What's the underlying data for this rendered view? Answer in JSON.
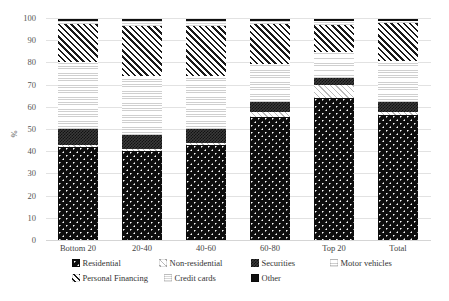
{
  "chart_data": {
    "type": "bar",
    "stacked": true,
    "stack_mode": "percent",
    "title": "",
    "xlabel": "",
    "ylabel": "%",
    "ylim": [
      0,
      100
    ],
    "yticks": [
      0,
      10,
      20,
      30,
      40,
      50,
      60,
      70,
      80,
      90,
      100
    ],
    "grid": true,
    "legend_position": "bottom",
    "categories": [
      "Bottom 20",
      "20-40",
      "40-60",
      "60-80",
      "Top 20",
      "Total"
    ],
    "series": [
      {
        "name": "Residential",
        "values": [
          42.0,
          40.3,
          43.0,
          55.5,
          64.0,
          56.5
        ],
        "pattern": "dotted-dark",
        "color": "#0d0d0d"
      },
      {
        "name": "Non-residential",
        "values": [
          1.0,
          0.7,
          1.0,
          2.5,
          6.0,
          1.5
        ],
        "pattern": "light-diagonal",
        "color": "#f3f3f3"
      },
      {
        "name": "Securities",
        "values": [
          7.0,
          6.2,
          6.0,
          4.5,
          3.2,
          4.5
        ],
        "pattern": "checker-dark",
        "color": "#3a3a3a"
      },
      {
        "name": "Motor vehicles",
        "values": [
          30.5,
          27.0,
          24.0,
          17.0,
          11.5,
          18.5
        ],
        "pattern": "light-horizontal",
        "color": "#fbfbfb"
      },
      {
        "name": "Personal Financing",
        "values": [
          17.0,
          22.5,
          22.5,
          18.0,
          12.5,
          17.0
        ],
        "pattern": "diagonal-hatch",
        "color": "#1a1a1a"
      },
      {
        "name": "Credit cards",
        "values": [
          1.5,
          2.3,
          2.5,
          1.5,
          1.8,
          1.0
        ],
        "pattern": "very-light",
        "color": "#fdfdfd"
      },
      {
        "name": "Other",
        "values": [
          1.0,
          1.0,
          1.0,
          1.0,
          1.0,
          1.0
        ],
        "pattern": "solid-dark",
        "color": "#101010"
      }
    ]
  },
  "axis": {
    "y_title": "%",
    "y_ticks": [
      "0",
      "10",
      "20",
      "30",
      "40",
      "50",
      "60",
      "70",
      "80",
      "90",
      "100"
    ],
    "x_ticks": [
      "Bottom 20",
      "20-40",
      "40-60",
      "60-80",
      "Top 20",
      "Total"
    ]
  },
  "legend": {
    "row1": [
      {
        "label": "Residential"
      },
      {
        "label": "Non-residential"
      },
      {
        "label": "Securities"
      },
      {
        "label": "Motor vehicles"
      }
    ],
    "row2": [
      {
        "label": "Personal Financing"
      },
      {
        "label": "Credit cards"
      },
      {
        "label": "Other"
      }
    ]
  }
}
